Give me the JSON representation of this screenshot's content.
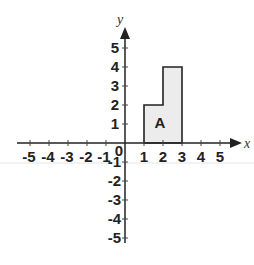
{
  "diagram": {
    "type": "coordinate-plane",
    "x_axis": {
      "label": "x",
      "range": [
        -5,
        5
      ],
      "ticks": [
        -5,
        -4,
        -3,
        -2,
        -1,
        1,
        2,
        3,
        4,
        5
      ],
      "tick_labels": [
        "-5",
        "-4",
        "-3",
        "-2",
        "-1",
        "1",
        "2",
        "3",
        "4",
        "5"
      ]
    },
    "y_axis": {
      "label": "y",
      "range": [
        -5,
        5
      ],
      "ticks": [
        5,
        4,
        3,
        2,
        1,
        -1,
        -2,
        -3,
        -4,
        -5
      ],
      "tick_labels": [
        "5",
        "4",
        "3",
        "2",
        "1",
        "-1",
        "-2",
        "-3",
        "-4",
        "-5"
      ]
    },
    "origin_label": "0",
    "shape": {
      "name": "A",
      "label": "A",
      "vertices": [
        [
          1,
          0
        ],
        [
          1,
          2
        ],
        [
          2,
          2
        ],
        [
          2,
          4
        ],
        [
          3,
          4
        ],
        [
          3,
          0
        ]
      ],
      "fill": "#ececec",
      "stroke": "#222222"
    },
    "colors": {
      "axis": "#222222",
      "background": "#ffffff",
      "guide_line": "#e4e4e4"
    }
  }
}
